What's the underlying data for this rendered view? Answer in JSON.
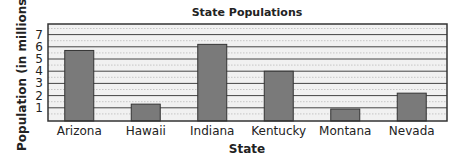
{
  "chart_data": {
    "type": "bar",
    "title": "State Populations",
    "xlabel": "State",
    "ylabel": "Population (in millions)",
    "categories": [
      "Arizona",
      "Hawaii",
      "Indiana",
      "Kentucky",
      "Montana",
      "Nevada"
    ],
    "values": [
      5.7,
      1.3,
      6.2,
      4.0,
      0.9,
      2.2
    ],
    "ylim": [
      0,
      8
    ],
    "yticks": [
      "1",
      "2",
      "3",
      "4",
      "5",
      "6",
      "7"
    ],
    "grid": true,
    "legend": "none",
    "colors": {
      "bar": "#7a7a7a",
      "bar_edge": "#333333",
      "grid": "#444444",
      "minor_grid": "#bbbbbb",
      "plot_bg": "#f1f1f1"
    }
  }
}
